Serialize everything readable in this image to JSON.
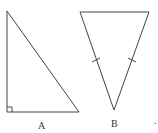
{
  "diagram": {
    "stroke_color": "#444444",
    "shapes": [
      {
        "id": "A",
        "type": "right-triangle",
        "label": "A",
        "vertices": [
          [
            7,
            11
          ],
          [
            7,
            112
          ],
          [
            79,
            112
          ]
        ],
        "right_angle_at": [
          7,
          112
        ]
      },
      {
        "id": "B",
        "type": "isosceles-triangle",
        "label": "B",
        "vertices": [
          [
            80,
            12
          ],
          [
            149,
            12
          ],
          [
            114,
            110
          ]
        ],
        "equal_sides_marked": true
      }
    ],
    "stray_mark": "."
  }
}
